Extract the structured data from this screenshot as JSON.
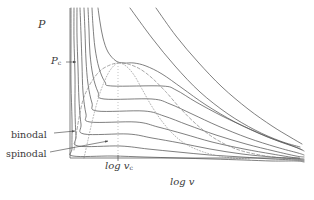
{
  "figure": {
    "title": "",
    "axes": {
      "ylabel": "P",
      "xlabel": "log v",
      "ylabel_icon": "pressure-axis-label",
      "xlabel_icon": "log-volume-axis-label"
    },
    "annotations": {
      "critical_pressure": {
        "base": "P",
        "sub": "c"
      },
      "critical_volume_tick": {
        "base": "log v",
        "sub": "c"
      },
      "binodal": "binodal",
      "spinodal": "spinodal"
    },
    "colors": {
      "background": "#ffffff",
      "axis": "#4a4a4a",
      "isotherm": "#555555",
      "binodal": "#8a8a8a",
      "spinodal": "#9a9a9a",
      "text": "#3a3a3a"
    }
  },
  "chart_data": {
    "type": "line",
    "xlabel": "log v",
    "ylabel": "P",
    "xlim": [
      0,
      1
    ],
    "ylim": [
      0,
      1
    ],
    "grid": false,
    "legend": "none",
    "axis_geometry": {
      "x_axis_pixels": {
        "x0": 70,
        "x1": 300,
        "y": 158
      },
      "y_axis_pixels": {
        "x": 70,
        "y0": 8,
        "y1": 158
      },
      "critical_volume_tick_x_pixel": 118,
      "critical_pressure_y_pixel": 63
    },
    "critical_point": {
      "label_P": "P_c",
      "label_v": "log v_c",
      "x": 118,
      "y": 63
    },
    "series": [
      {
        "name": "isotherm-supercritical-1",
        "style": "solid",
        "points": [
          [
            130,
            8
          ],
          [
            152,
            38
          ],
          [
            175,
            66
          ],
          [
            200,
            92
          ],
          [
            228,
            114
          ],
          [
            255,
            130
          ],
          [
            280,
            141
          ],
          [
            300,
            147
          ]
        ]
      },
      {
        "name": "isotherm-supercritical-2",
        "style": "solid",
        "points": [
          [
            156,
            8
          ],
          [
            176,
            36
          ],
          [
            198,
            62
          ],
          [
            222,
            87
          ],
          [
            248,
            109
          ],
          [
            272,
            126
          ],
          [
            290,
            137
          ],
          [
            302,
            144
          ]
        ]
      },
      {
        "name": "isotherm-critical",
        "style": "solid",
        "points": [
          [
            98,
            8
          ],
          [
            100,
            22
          ],
          [
            103,
            38
          ],
          [
            108,
            52
          ],
          [
            116,
            61
          ],
          [
            124,
            63
          ],
          [
            134,
            63
          ],
          [
            146,
            66
          ],
          [
            162,
            74
          ],
          [
            182,
            88
          ],
          [
            206,
            105
          ],
          [
            235,
            122
          ],
          [
            265,
            136
          ],
          [
            290,
            145
          ],
          [
            302,
            150
          ]
        ]
      },
      {
        "name": "isotherm-sub-1",
        "style": "solid-with-plateau",
        "plateau_y": 86,
        "points": [
          [
            92,
            8
          ],
          [
            93,
            26
          ],
          [
            95,
            48
          ],
          [
            99,
            68
          ],
          [
            105,
            82
          ],
          [
            112,
            86
          ],
          [
            162,
            86
          ],
          [
            176,
            90
          ],
          [
            196,
            102
          ],
          [
            222,
            116
          ],
          [
            252,
            130
          ],
          [
            278,
            141
          ],
          [
            298,
            148
          ],
          [
            304,
            151
          ]
        ]
      },
      {
        "name": "isotherm-sub-2",
        "style": "solid-with-plateau",
        "plateau_y": 99,
        "points": [
          [
            88,
            8
          ],
          [
            89,
            30
          ],
          [
            90,
            54
          ],
          [
            93,
            76
          ],
          [
            98,
            92
          ],
          [
            104,
            99
          ],
          [
            152,
            99
          ],
          [
            170,
            104
          ],
          [
            192,
            114
          ],
          [
            218,
            126
          ],
          [
            248,
            138
          ],
          [
            276,
            147
          ],
          [
            298,
            153
          ],
          [
            304,
            155
          ]
        ]
      },
      {
        "name": "isotherm-sub-3",
        "style": "solid-with-plateau",
        "plateau_y": 111,
        "points": [
          [
            84,
            8
          ],
          [
            85,
            32
          ],
          [
            86,
            60
          ],
          [
            88,
            84
          ],
          [
            92,
            103
          ],
          [
            97,
            111
          ],
          [
            144,
            111
          ],
          [
            164,
            116
          ],
          [
            188,
            125
          ],
          [
            216,
            135
          ],
          [
            246,
            144
          ],
          [
            274,
            151
          ],
          [
            296,
            156
          ],
          [
            304,
            157
          ]
        ]
      },
      {
        "name": "isotherm-sub-4",
        "style": "solid-with-plateau",
        "plateau_y": 122,
        "points": [
          [
            80,
            8
          ],
          [
            81,
            34
          ],
          [
            82,
            64
          ],
          [
            83,
            92
          ],
          [
            86,
            114
          ],
          [
            90,
            122
          ],
          [
            136,
            122
          ],
          [
            158,
            127
          ],
          [
            184,
            134
          ],
          [
            212,
            142
          ],
          [
            244,
            149
          ],
          [
            272,
            154
          ],
          [
            296,
            158
          ],
          [
            304,
            159
          ]
        ]
      },
      {
        "name": "isotherm-sub-5",
        "style": "solid-with-plateau",
        "plateau_y": 134,
        "points": [
          [
            77,
            8
          ],
          [
            77,
            36
          ],
          [
            78,
            68
          ],
          [
            79,
            100
          ],
          [
            81,
            124
          ],
          [
            84,
            134
          ],
          [
            128,
            134
          ],
          [
            152,
            138
          ],
          [
            180,
            143
          ],
          [
            210,
            149
          ],
          [
            242,
            154
          ],
          [
            272,
            157
          ],
          [
            296,
            159
          ],
          [
            304,
            160
          ]
        ]
      },
      {
        "name": "isotherm-sub-6",
        "style": "solid-with-plateau",
        "plateau_y": 146,
        "points": [
          [
            74,
            8
          ],
          [
            74,
            40
          ],
          [
            75,
            76
          ],
          [
            75,
            110
          ],
          [
            76,
            136
          ],
          [
            78,
            146
          ],
          [
            120,
            146
          ],
          [
            148,
            149
          ],
          [
            178,
            152
          ],
          [
            210,
            155
          ],
          [
            242,
            157
          ],
          [
            272,
            159
          ],
          [
            296,
            160
          ],
          [
            304,
            161
          ]
        ]
      },
      {
        "name": "isotherm-sub-7",
        "style": "solid-with-plateau",
        "plateau_y": 156,
        "points": [
          [
            71,
            8
          ],
          [
            71,
            44
          ],
          [
            71,
            84
          ],
          [
            72,
            120
          ],
          [
            72,
            148
          ],
          [
            73,
            156
          ],
          [
            112,
            156
          ],
          [
            144,
            157
          ],
          [
            178,
            158
          ],
          [
            212,
            159
          ],
          [
            244,
            160
          ],
          [
            272,
            161
          ],
          [
            296,
            161
          ],
          [
            304,
            162
          ]
        ]
      }
    ],
    "binodal": {
      "name": "binodal-curve",
      "style": "dashed",
      "points": [
        [
          74,
          150
        ],
        [
          76,
          136
        ],
        [
          79,
          118
        ],
        [
          83,
          100
        ],
        [
          88,
          88
        ],
        [
          94,
          78
        ],
        [
          101,
          70
        ],
        [
          110,
          65
        ],
        [
          118,
          63
        ],
        [
          128,
          64
        ],
        [
          140,
          69
        ],
        [
          152,
          78
        ],
        [
          166,
          92
        ],
        [
          180,
          108
        ],
        [
          196,
          124
        ],
        [
          214,
          138
        ],
        [
          236,
          149
        ],
        [
          260,
          155
        ],
        [
          284,
          158
        ],
        [
          300,
          159
        ]
      ]
    },
    "spinodal": {
      "name": "spinodal-curve",
      "style": "dotted",
      "points": [
        [
          84,
          158
        ],
        [
          88,
          140
        ],
        [
          93,
          118
        ],
        [
          99,
          96
        ],
        [
          105,
          80
        ],
        [
          111,
          69
        ],
        [
          118,
          63
        ],
        [
          126,
          66
        ],
        [
          134,
          75
        ],
        [
          142,
          89
        ],
        [
          151,
          105
        ],
        [
          161,
          120
        ],
        [
          172,
          133
        ],
        [
          184,
          143
        ],
        [
          198,
          150
        ],
        [
          214,
          155
        ],
        [
          232,
          158
        ],
        [
          250,
          159
        ]
      ]
    },
    "pointer_arrows": [
      {
        "name": "binodal-arrow",
        "from": [
          54,
          133
        ],
        "to": [
          75,
          131
        ]
      },
      {
        "name": "spinodal-arrow",
        "from": [
          50,
          152
        ],
        "to": [
          108,
          141
        ]
      },
      {
        "name": "pc-arrow",
        "from": [
          66,
          62
        ],
        "to": [
          76,
          62
        ]
      }
    ]
  }
}
